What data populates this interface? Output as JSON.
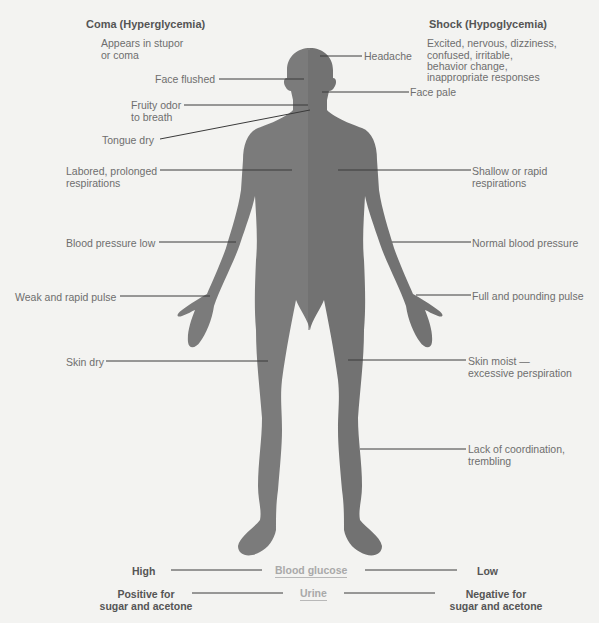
{
  "colors": {
    "background": "#f3f3f1",
    "silhouette": "#7a7a7a",
    "silhouette_right": "#727272",
    "leader_line": "#3a3a3a",
    "text": "#6e6e6e",
    "heading": "#555555",
    "center_label": "#a9a9a9"
  },
  "left_column": {
    "title": "Coma (Hyperglycemia)",
    "intro_line1": "Appears in stupor",
    "intro_line2": "or coma",
    "labels": [
      {
        "line1": "Face flushed",
        "line2": ""
      },
      {
        "line1": "Fruity odor",
        "line2": "to breath"
      },
      {
        "line1": "Tongue dry",
        "line2": ""
      },
      {
        "line1": "Labored, prolonged",
        "line2": "respirations"
      },
      {
        "line1": "Blood pressure low",
        "line2": ""
      },
      {
        "line1": "Weak and rapid pulse",
        "line2": ""
      },
      {
        "line1": "Skin dry",
        "line2": ""
      }
    ]
  },
  "right_column": {
    "title": "Shock (Hypoglycemia)",
    "intro_lines": [
      "Excited, nervous, dizziness,",
      "confused, irritable,",
      "behavior change,",
      "inappropriate responses"
    ],
    "labels": [
      {
        "line1": "Headache",
        "line2": ""
      },
      {
        "line1": "Face pale",
        "line2": ""
      },
      {
        "line1": "Shallow or rapid",
        "line2": "respirations"
      },
      {
        "line1": "Normal blood pressure",
        "line2": ""
      },
      {
        "line1": "Full and pounding pulse",
        "line2": ""
      },
      {
        "line1": "Skin moist —",
        "line2": "excessive perspiration"
      },
      {
        "line1": "Lack of coordination,",
        "line2": "trembling"
      }
    ]
  },
  "bottom": {
    "blood_glucose": {
      "left": "High",
      "center": "Blood glucose",
      "right": "Low"
    },
    "urine": {
      "left_line1": "Positive for",
      "left_line2": "sugar and acetone",
      "center": "Urine",
      "right_line1": "Negative for",
      "right_line2": "sugar and acetone"
    }
  }
}
